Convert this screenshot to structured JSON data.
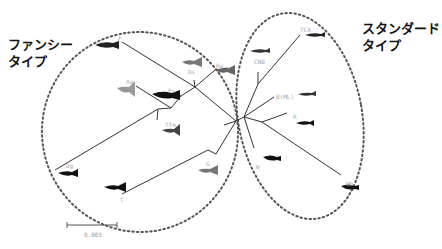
{
  "groups": {
    "fancy": {
      "label": "ファンシー\nタイプ"
    },
    "standard": {
      "label": "スタンダード\nタイプ"
    }
  },
  "leaves": {
    "F": "F",
    "Ds": "Ds",
    "Ra": "Ra",
    "Aa": "Aa",
    "Fs": "Fs",
    "Tfm": "Tfm",
    "Dg": "Dg",
    "T": "T",
    "G": "G",
    "TCA": "TCA",
    "CNB": "CNB",
    "BML": "B(ML)",
    "R": "R",
    "W": "W",
    "Wb": "Wb"
  },
  "scale_bar": {
    "label": "0.005"
  },
  "colors": {
    "line": "#333333",
    "dots": "#555555",
    "fish": "#222222"
  }
}
